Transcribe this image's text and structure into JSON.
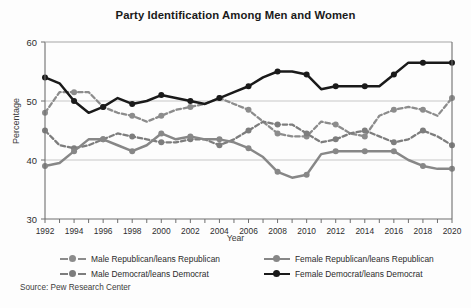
{
  "title": "Party Identification Among Men and Women",
  "source_note": "Source: Pew Research Center",
  "axis": {
    "xlabel": "Year",
    "ylabel": "Percentage",
    "ytick_labels": [
      "30",
      "40",
      "50",
      "60"
    ],
    "xtick_labels": [
      "1992",
      "1994",
      "1996",
      "1998",
      "2000",
      "2002",
      "2004",
      "2006",
      "2008",
      "2010",
      "2012",
      "2014",
      "2016",
      "2018",
      "2020"
    ]
  },
  "legend": {
    "left": [
      {
        "label": "Male Republican/leans Republican",
        "color": "#8c8c8c",
        "style": "dashed",
        "marker": "circle"
      },
      {
        "label": "Male Democrat/leans Democrat",
        "color": "#7d7d7d",
        "style": "dashed",
        "marker": "circle"
      }
    ],
    "right": [
      {
        "label": "Female Republican/leans Republican",
        "color": "#878787",
        "style": "solid",
        "marker": "circle"
      },
      {
        "label": "Female Democrat/leans Democrat",
        "color": "#1a1a1a",
        "style": "solid",
        "marker": "circle"
      }
    ]
  },
  "colors": {
    "male_republican": "#8c8c8c",
    "male_democrat": "#7d7d7d",
    "female_republican": "#878787",
    "female_democrat": "#1a1a1a",
    "axis": "#6f6f6f",
    "grid": "#b9b9b9",
    "background": "#fdfdfd"
  },
  "chart_data": {
    "type": "line",
    "title": "Party Identification Among Men and Women",
    "xlabel": "Year",
    "ylabel": "Percentage",
    "xlim": [
      1992,
      2020
    ],
    "ylim": [
      30,
      60
    ],
    "yticks": [
      30,
      40,
      50,
      60
    ],
    "grid": "horizontal",
    "legend_position": "below",
    "source": "Source: Pew Research Center",
    "x": [
      1992,
      1993,
      1994,
      1995,
      1996,
      1997,
      1998,
      1999,
      2000,
      2001,
      2002,
      2003,
      2004,
      2005,
      2006,
      2007,
      2008,
      2009,
      2010,
      2011,
      2012,
      2013,
      2014,
      2015,
      2016,
      2017,
      2018,
      2019,
      2020
    ],
    "series": [
      {
        "name": "Male Republican/leans Republican",
        "key": "male_republican",
        "style": "dashed",
        "color": "#8c8c8c",
        "values": [
          48.0,
          51.5,
          51.5,
          51.5,
          49.0,
          48.0,
          47.5,
          46.5,
          47.5,
          48.5,
          49.0,
          49.5,
          50.5,
          49.5,
          48.5,
          46.5,
          44.5,
          44.0,
          44.0,
          46.5,
          46.0,
          44.5,
          44.0,
          47.5,
          48.5,
          49.0,
          48.5,
          47.5,
          50.5
        ]
      },
      {
        "name": "Male Democrat/leans Democrat",
        "key": "male_democrat",
        "style": "dashed",
        "color": "#7d7d7d",
        "values": [
          45.0,
          42.5,
          42.0,
          42.5,
          43.5,
          44.5,
          44.0,
          43.5,
          43.0,
          43.0,
          43.5,
          43.5,
          42.5,
          43.5,
          45.0,
          46.5,
          46.0,
          46.0,
          44.5,
          43.0,
          43.5,
          44.5,
          45.0,
          44.0,
          43.0,
          43.5,
          45.0,
          44.0,
          42.5
        ]
      },
      {
        "name": "Female Republican/leans Republican",
        "key": "female_republican",
        "style": "solid",
        "color": "#878787",
        "values": [
          39.0,
          39.5,
          41.5,
          43.5,
          43.5,
          42.5,
          41.5,
          42.5,
          44.5,
          43.5,
          44.0,
          43.5,
          43.5,
          43.0,
          42.0,
          40.5,
          38.0,
          37.0,
          37.5,
          41.0,
          41.5,
          41.5,
          41.5,
          41.5,
          41.5,
          40.0,
          39.0,
          38.5,
          38.5
        ]
      },
      {
        "name": "Female Democrat/leans Democrat",
        "key": "female_democrat",
        "style": "solid",
        "color": "#1a1a1a",
        "values": [
          54.0,
          53.0,
          50.0,
          48.0,
          49.0,
          50.5,
          49.5,
          50.0,
          51.0,
          50.5,
          50.0,
          49.5,
          50.5,
          51.5,
          52.5,
          54.0,
          55.0,
          55.0,
          54.5,
          52.0,
          52.5,
          52.5,
          52.5,
          52.5,
          54.5,
          56.5,
          56.5,
          56.5,
          56.5
        ]
      }
    ]
  }
}
